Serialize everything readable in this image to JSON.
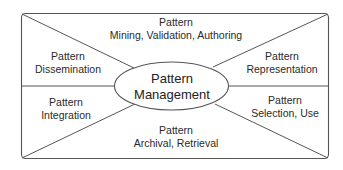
{
  "diagram": {
    "type": "hub-and-spoke partition",
    "center": {
      "line1": "Pattern",
      "line2": "Management"
    },
    "regions": {
      "top": {
        "line1": "Pattern",
        "line2": "Mining, Validation, Authoring"
      },
      "upper_left": {
        "line1": "Pattern",
        "line2": "Dissemination"
      },
      "upper_right": {
        "line1": "Pattern",
        "line2": "Representation"
      },
      "lower_left": {
        "line1": "Pattern",
        "line2": "Integration"
      },
      "lower_right": {
        "line1": "Pattern",
        "line2": "Selection, Use"
      },
      "bottom": {
        "line1": "Pattern",
        "line2": "Archival,  Retrieval"
      }
    },
    "colors": {
      "stroke": "#555555",
      "text": "#2a2a2a",
      "background": "#ffffff"
    }
  }
}
